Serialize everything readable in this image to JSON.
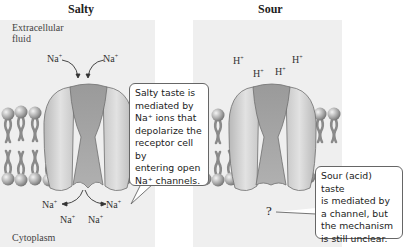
{
  "partial_heading": "",
  "panels": {
    "salty": {
      "title": "Salty",
      "extracellular_label_line1": "Extracellular",
      "extracellular_label_line2": "fluid",
      "cytoplasm_label": "Cytoplasm",
      "ions_outside": [
        "Na",
        "Na"
      ],
      "ions_inside": [
        "Na",
        "Na",
        "Na",
        "Na"
      ],
      "ion_charge": "+",
      "callout": {
        "lines": [
          "Salty taste is",
          "mediated by",
          "Na⁺ ions that",
          "depolarize the",
          "receptor cell by",
          "entering open",
          "Na⁺ channels."
        ]
      }
    },
    "sour": {
      "title": "Sour",
      "ions_outside": [
        "H",
        "H",
        "H",
        "H"
      ],
      "ion_charge": "+",
      "unknown_mark": "?",
      "callout": {
        "lines": [
          "Sour (acid) taste",
          "is mediated by",
          "a channel, but",
          "the mechanism",
          "is still unclear."
        ]
      }
    }
  },
  "colors": {
    "panel_bg": "#efefef",
    "channel_light": "#d4d4d4",
    "channel_dark": "#9a9a9a",
    "lipid_head": "#9c9c9c",
    "lipid_tail": "#8c8c8c"
  }
}
